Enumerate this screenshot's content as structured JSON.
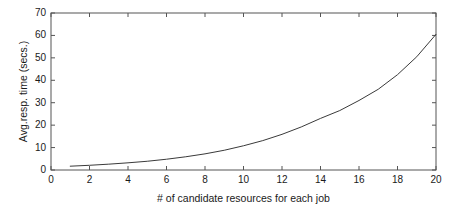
{
  "chart_data": {
    "type": "line",
    "title": "",
    "xlabel": "# of candidate resources for each job",
    "ylabel": "Avg.resp. time (secs.)",
    "xlim": [
      0,
      20
    ],
    "ylim": [
      0,
      70
    ],
    "xticks": [
      0,
      2,
      4,
      6,
      8,
      10,
      12,
      14,
      16,
      18,
      20
    ],
    "yticks": [
      0,
      10,
      20,
      30,
      40,
      50,
      60,
      70
    ],
    "grid": false,
    "legend": null,
    "line_color": "#3a3a3a",
    "frame_color": "#555555",
    "background": "#ffffff",
    "series": [
      {
        "name": "Avg. response time",
        "x": [
          1,
          2,
          3,
          4,
          5,
          6,
          7,
          8,
          9,
          10,
          11,
          12,
          13,
          14,
          15,
          16,
          17,
          18,
          19,
          20
        ],
        "values": [
          1.7,
          2.1,
          2.6,
          3.2,
          3.9,
          4.8,
          5.9,
          7.2,
          8.8,
          10.8,
          13.1,
          15.9,
          19.2,
          23.0,
          26.5,
          31.0,
          36.0,
          42.5,
          50.5,
          60.5
        ]
      }
    ]
  },
  "axes": {
    "y_tick_labels": [
      "0",
      "10",
      "20",
      "30",
      "40",
      "50",
      "60",
      "70"
    ],
    "x_tick_labels": [
      "0",
      "2",
      "4",
      "6",
      "8",
      "10",
      "12",
      "14",
      "16",
      "18",
      "20"
    ],
    "y_axis_title": "Avg.resp. time (secs.)",
    "x_axis_title": "# of candidate resources for each job"
  }
}
